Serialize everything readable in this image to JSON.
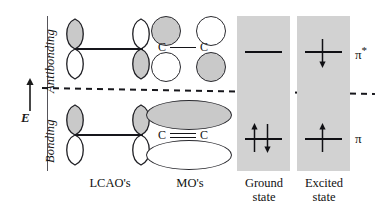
{
  "figure": {
    "type": "molecular-orbital-energy-diagram"
  },
  "axis": {
    "energy_symbol": "E",
    "arrow_direction": "up",
    "regions": {
      "upper_label": "Antibonding",
      "lower_label": "Bonding"
    },
    "divider": "dashed"
  },
  "columns": [
    {
      "key": "lcao",
      "label": "LCAO's"
    },
    {
      "key": "mo",
      "label": "MO's"
    },
    {
      "key": "ground",
      "label_line1": "Ground",
      "label_line2": "state"
    },
    {
      "key": "excited",
      "label_line1": "Excited",
      "label_line2": "state"
    }
  ],
  "orbital_labels": {
    "antibonding": "π",
    "antibonding_superscript": "*",
    "bonding": "π"
  },
  "lcao": {
    "antibonding": {
      "description": "two p orbitals, out-of-phase",
      "left_top_shaded": true,
      "left_bottom_shaded": false,
      "right_top_shaded": false,
      "right_bottom_shaded": true
    },
    "bonding": {
      "description": "two p orbitals, in-phase",
      "left_top_shaded": true,
      "left_bottom_shaded": false,
      "right_top_shaded": true,
      "right_bottom_shaded": false
    }
  },
  "mo": {
    "antibonding": {
      "bond_text_left": "C",
      "bond_text_right": "C",
      "bond_order": "single",
      "lobes": [
        {
          "position": "top-left",
          "shaded": true
        },
        {
          "position": "top-right",
          "shaded": false
        },
        {
          "position": "bottom-left",
          "shaded": false
        },
        {
          "position": "bottom-right",
          "shaded": true
        }
      ]
    },
    "bonding": {
      "bond_text_left": "C",
      "bond_text_right": "C",
      "bond_order": "double",
      "lobes": [
        {
          "position": "top",
          "shaded": true
        },
        {
          "position": "bottom",
          "shaded": false
        }
      ]
    }
  },
  "states": {
    "ground": {
      "antibonding_electrons": 0,
      "antibonding_spins": [],
      "bonding_electrons": 2,
      "bonding_spins": [
        "up",
        "down"
      ]
    },
    "excited": {
      "antibonding_electrons": 1,
      "antibonding_spins": [
        "down"
      ],
      "bonding_electrons": 1,
      "bonding_spins": [
        "up"
      ]
    }
  },
  "colors": {
    "shaded_lobe": "#c9c9c9",
    "panel_background": "#d2d2d2",
    "ink": "#111111",
    "page_background": "#ffffff"
  }
}
